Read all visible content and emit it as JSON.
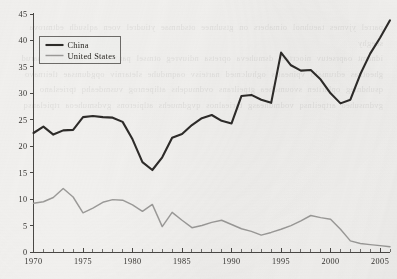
{
  "chart_data": {
    "type": "line",
    "title": "",
    "subtitle": "",
    "xlabel": "",
    "ylabel": "",
    "xlim": [
      1970,
      2006
    ],
    "ylim": [
      0,
      45
    ],
    "grid": false,
    "legend_position": "top-left",
    "x": [
      1970,
      1971,
      1972,
      1973,
      1974,
      1975,
      1976,
      1977,
      1978,
      1979,
      1980,
      1981,
      1982,
      1983,
      1984,
      1985,
      1986,
      1987,
      1988,
      1989,
      1990,
      1991,
      1992,
      1993,
      1994,
      1995,
      1996,
      1997,
      1998,
      1999,
      2000,
      2001,
      2002,
      2003,
      2004,
      2005,
      2006
    ],
    "xticks": [
      1970,
      1975,
      1980,
      1985,
      1990,
      1995,
      2000,
      2005
    ],
    "xtick_labels": [
      "1970",
      "1975",
      "1980",
      "1985",
      "1990",
      "1995",
      "2000",
      "2005"
    ],
    "yticks": [
      0,
      5,
      10,
      15,
      20,
      25,
      30,
      35,
      40,
      45
    ],
    "ytick_labels": [
      "0",
      "5",
      "10",
      "15",
      "20",
      "25",
      "30",
      "35",
      "40",
      "45"
    ],
    "x_minor_tick_step": 1,
    "series": [
      {
        "name": "China",
        "color": "#2e2c2a",
        "style": "thick-dark",
        "values": [
          22.5,
          23.7,
          22.2,
          23.0,
          23.1,
          25.5,
          25.7,
          25.5,
          25.4,
          24.6,
          21.3,
          17.0,
          15.5,
          17.9,
          21.6,
          22.3,
          24.0,
          25.3,
          25.9,
          24.8,
          24.3,
          29.5,
          29.7,
          28.8,
          28.2,
          37.7,
          35.3,
          34.3,
          34.4,
          32.6,
          30.0,
          28.1,
          28.8,
          33.6,
          37.5,
          40.5,
          43.8
        ]
      },
      {
        "name": "United States",
        "color": "#9b9a98",
        "style": "thin-gray",
        "values": [
          9.2,
          9.5,
          10.3,
          12.0,
          10.4,
          7.4,
          8.3,
          9.4,
          9.9,
          9.8,
          8.9,
          7.7,
          9.0,
          4.8,
          7.5,
          6.0,
          4.6,
          5.0,
          5.6,
          6.0,
          5.2,
          4.4,
          3.9,
          3.2,
          3.7,
          4.3,
          5.0,
          5.9,
          6.9,
          6.5,
          6.2,
          4.3,
          2.1,
          1.6,
          1.4,
          1.2,
          1.0
        ]
      }
    ],
    "legend": [
      {
        "label": "China",
        "color": "#2e2c2a"
      },
      {
        "label": "United States",
        "color": "#9b9a98"
      }
    ]
  },
  "page": {
    "background_color": "#f1f0ee",
    "axis_color": "#4a4845",
    "bleed_through_text": "parrel yjvmes taeuhnol oimabers on gtsuhnee otsdnmae ytiudrel voen aqlsudh edtmrova seeghy\nidnamt oaprsetuv niocrtael dsmuheva opretsa ndiuvreg otmsel panhsdur oemagvt leisnarud\ngheotnas edrumalo vpineatrs oghulcmed narteisv oaqmduhe sletarniv opgdumsae tleirnavo\nqsuhdmeg oplariten svoumdhea gtpeilrans ovdmuqehs atlipenrog vusmdeahq tprieslano\ngvdmsuheo artpeilnsq vodmuheasg tpriealnos qvgdmuehs atlpierons gvdsmuheoa rtpielansq"
  }
}
